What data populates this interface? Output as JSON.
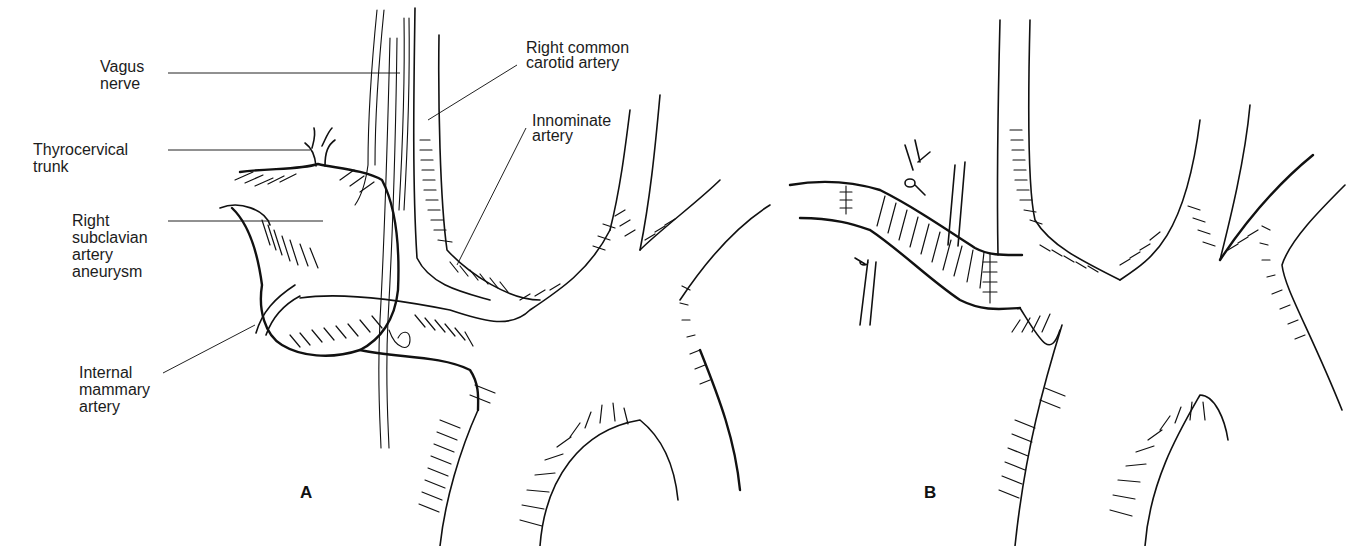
{
  "figure": {
    "type": "anatomical surgical illustration",
    "panels": [
      {
        "id": "A",
        "letter": "A",
        "labels": [
          {
            "key": "vagus",
            "text": "Vagus\nnerve"
          },
          {
            "key": "thyrocervical",
            "text": "Thyrocervical\ntrunk"
          },
          {
            "key": "aneurysm",
            "text": "Right\nsubclavian\nartery\naneurysm"
          },
          {
            "key": "mammary",
            "text": "Internal\nmammary\nartery"
          },
          {
            "key": "carotid",
            "text": "Right common\ncarotid artery"
          },
          {
            "key": "innominate",
            "text": "Innominate\nartery"
          }
        ]
      },
      {
        "id": "B",
        "letter": "B",
        "labels": []
      }
    ]
  },
  "colors": {
    "ink": "#111111",
    "background": "#ffffff"
  }
}
